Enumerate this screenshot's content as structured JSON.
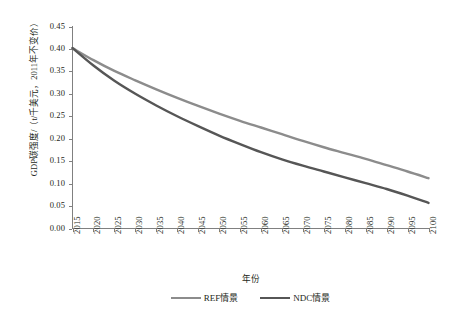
{
  "chart_data": {
    "type": "line",
    "title": "",
    "xlabel": "年份",
    "ylabel": "GDP碳强度/（t/千美元，2011年不变价）",
    "x": [
      2015,
      2020,
      2025,
      2030,
      2035,
      2040,
      2045,
      2050,
      2055,
      2060,
      2065,
      2070,
      2075,
      2080,
      2085,
      2090,
      2095,
      2100
    ],
    "xlim": [
      2015,
      2100
    ],
    "ylim": [
      0.0,
      0.45
    ],
    "yticks": [
      "0.00",
      "0.05",
      "0.10",
      "0.15",
      "0.20",
      "0.25",
      "0.30",
      "0.35",
      "0.40",
      "0.45"
    ],
    "ytick_values": [
      0.0,
      0.05,
      0.1,
      0.15,
      0.2,
      0.25,
      0.3,
      0.35,
      0.4,
      0.45
    ],
    "grid": false,
    "legend_position": "bottom",
    "series": [
      {
        "name": "REF情景",
        "color": "#8c8c8c",
        "values": [
          0.402,
          0.375,
          0.351,
          0.33,
          0.31,
          0.291,
          0.273,
          0.256,
          0.24,
          0.225,
          0.21,
          0.195,
          0.181,
          0.168,
          0.155,
          0.141,
          0.127,
          0.112
        ]
      },
      {
        "name": "NDC情景",
        "color": "#565656",
        "values": [
          0.402,
          0.363,
          0.329,
          0.3,
          0.274,
          0.25,
          0.228,
          0.207,
          0.188,
          0.17,
          0.154,
          0.14,
          0.127,
          0.114,
          0.101,
          0.088,
          0.073,
          0.057
        ]
      }
    ]
  },
  "axes": {
    "x_title": "年份",
    "y_title": "GDP碳强度/（t/千美元，2011年不变价）",
    "x_tick_labels": [
      "2015",
      "2020",
      "2025",
      "2030",
      "2035",
      "2040",
      "2045",
      "2050",
      "2055",
      "2060",
      "2065",
      "2070",
      "2075",
      "2080",
      "2085",
      "2090",
      "2095",
      "2100"
    ],
    "y_tick_labels": [
      "0.45",
      "0.40",
      "0.35",
      "0.30",
      "0.25",
      "0.20",
      "0.15",
      "0.10",
      "0.05",
      "0.00"
    ]
  },
  "legend": {
    "items": [
      {
        "label": "REF情景",
        "color": "#8c8c8c"
      },
      {
        "label": "NDC情景",
        "color": "#565656"
      }
    ]
  },
  "colors": {
    "axis": "#808080",
    "text": "#231f20",
    "background": "#ffffff"
  }
}
